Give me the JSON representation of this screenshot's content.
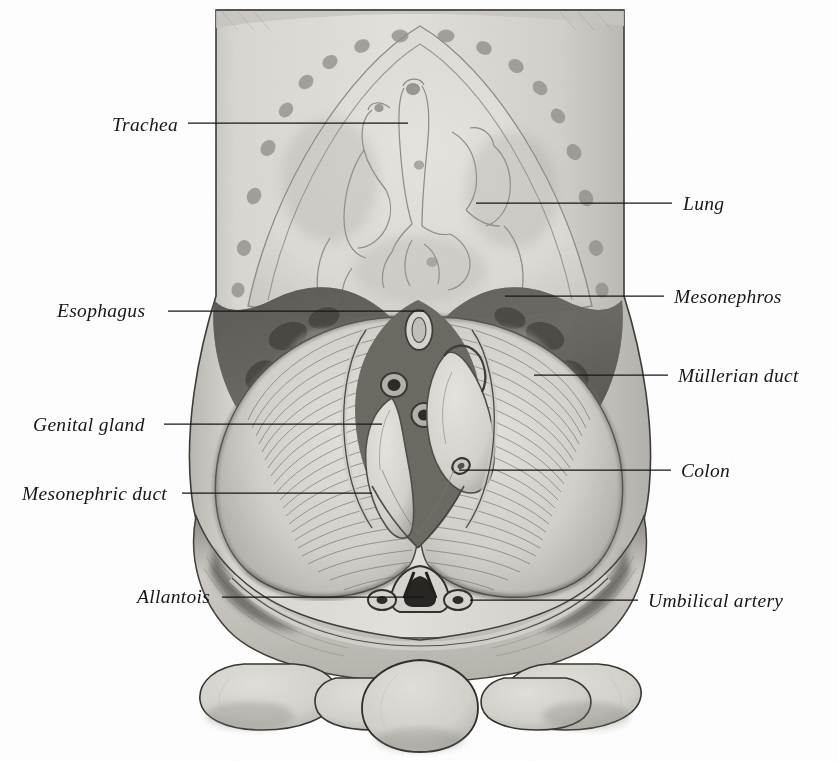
{
  "figure": {
    "medium": "halftone engraving",
    "background_color": "#ffffff",
    "ink_color": "#17171a",
    "tissue_light": "#d5d3ce",
    "tissue_mid": "#a9a6a0",
    "tissue_dark": "#55534f",
    "width": 838,
    "height": 761
  },
  "labels": [
    {
      "id": "trachea",
      "text": "Trachea",
      "side": "left",
      "text_x": 112,
      "text_y": 115,
      "line_x1": 188,
      "line_y1": 123,
      "line_x2": 408,
      "line_y2": 123
    },
    {
      "id": "esophagus",
      "text": "Esophagus",
      "side": "left",
      "text_x": 57,
      "text_y": 301,
      "line_x1": 168,
      "line_y1": 311,
      "line_x2": 424,
      "line_y2": 311
    },
    {
      "id": "genital-gland",
      "text": "Genital gland",
      "side": "left",
      "text_x": 33,
      "text_y": 415,
      "line_x1": 164,
      "line_y1": 424,
      "line_x2": 382,
      "line_y2": 424
    },
    {
      "id": "mesonephric-duct",
      "text": "Mesonephric duct",
      "side": "left",
      "text_x": 22,
      "text_y": 484,
      "line_x1": 182,
      "line_y1": 493,
      "line_x2": 372,
      "line_y2": 493
    },
    {
      "id": "allantois",
      "text": "Allantois",
      "side": "left",
      "text_x": 137,
      "text_y": 587,
      "line_x1": 222,
      "line_y1": 597,
      "line_x2": 424,
      "line_y2": 597
    },
    {
      "id": "lung",
      "text": "Lung",
      "side": "right",
      "text_x": 683,
      "text_y": 194,
      "line_x1": 476,
      "line_y1": 203,
      "line_x2": 672,
      "line_y2": 203
    },
    {
      "id": "mesonephros",
      "text": "Mesonephros",
      "side": "right",
      "text_x": 674,
      "text_y": 287,
      "line_x1": 505,
      "line_y1": 296,
      "line_x2": 664,
      "line_y2": 296
    },
    {
      "id": "mullerian-duct",
      "text": "Müllerian duct",
      "side": "right",
      "text_x": 678,
      "text_y": 366,
      "line_x1": 534,
      "line_y1": 375,
      "line_x2": 668,
      "line_y2": 375
    },
    {
      "id": "colon",
      "text": "Colon",
      "side": "right",
      "text_x": 681,
      "text_y": 461,
      "line_x1": 459,
      "line_y1": 470,
      "line_x2": 671,
      "line_y2": 470
    },
    {
      "id": "umbilical-artery",
      "text": "Umbilical artery",
      "side": "right",
      "text_x": 648,
      "text_y": 591,
      "line_x1": 470,
      "line_y1": 600,
      "line_x2": 638,
      "line_y2": 600
    }
  ],
  "structures": {
    "body_wall": "trunk cross-section outline",
    "thorax": "lung field with trachea and bronchi",
    "ribs_count": 20,
    "umbilical_cord_lobes": 5
  }
}
